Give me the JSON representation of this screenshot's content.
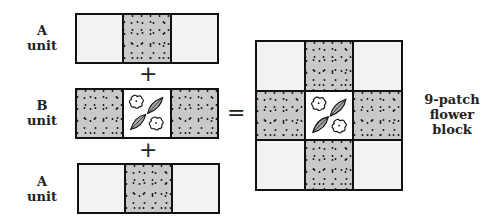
{
  "labels": {
    "top_a": {
      "line1": "A",
      "line2": "unit"
    },
    "b": {
      "line1": "B",
      "line2": "unit"
    },
    "bottom_a": {
      "line1": "A",
      "line2": "unit"
    },
    "result": {
      "line1": "9-patch",
      "line2": "flower",
      "line3": "block"
    }
  },
  "operators": {
    "plus_top": "+",
    "plus_bottom": "+",
    "equals": "="
  },
  "units": {
    "a_unit": [
      "plain",
      "dotted",
      "plain"
    ],
    "b_unit": [
      "dotted",
      "flower",
      "dotted"
    ]
  },
  "block": {
    "cells": [
      "plain",
      "dotted",
      "plain",
      "dotted",
      "flower",
      "dotted",
      "plain",
      "dotted",
      "plain"
    ]
  },
  "colors": {
    "outline": "#111111",
    "light_fabric": "#f2f2f2",
    "dotted_fabric": "#c9c9c9",
    "motif_fabric": "#ffffff",
    "leaf": "#a8a8a8"
  },
  "icons": {
    "motif": "flower-leaf-appliqué"
  }
}
